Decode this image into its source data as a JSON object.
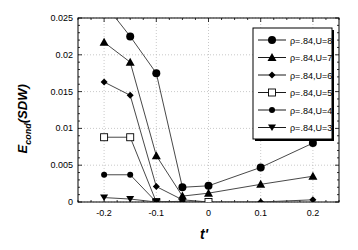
{
  "chart_data": {
    "type": "line",
    "title": "",
    "xlabel": "t'",
    "ylabel": "E_cond(SDW)",
    "ylabel_main": "E",
    "ylabel_sub": "cond",
    "ylabel_paren": "(SDW)",
    "xlim": [
      -0.25,
      0.25
    ],
    "ylim": [
      0,
      0.025
    ],
    "xticks": [
      -0.2,
      -0.1,
      0,
      0.1,
      0.2
    ],
    "xtick_labels": [
      "-0.2",
      "-0.1",
      "0",
      "0.1",
      "0.2"
    ],
    "yticks": [
      0,
      0.005,
      0.01,
      0.015,
      0.02,
      0.025
    ],
    "ytick_labels": [
      "0",
      "0.005",
      "0.01",
      "0.015",
      "0.02",
      "0.025"
    ],
    "grid": true,
    "legend_position": "upper right",
    "series": [
      {
        "name": "ρ=.84,U=8",
        "marker": "circle",
        "x": [
          -0.2,
          -0.15,
          -0.1,
          -0.05,
          0,
          0.1,
          0.2
        ],
        "values": [
          0.027,
          0.0225,
          0.0175,
          0.002,
          0.0022,
          0.0047,
          0.008
        ]
      },
      {
        "name": "ρ=.84,U=7",
        "marker": "triangle-up",
        "x": [
          -0.2,
          -0.15,
          -0.1,
          -0.05,
          0,
          0.1,
          0.2
        ],
        "values": [
          0.0217,
          0.019,
          0.0063,
          0.0008,
          0.0012,
          0.0024,
          0.0035
        ]
      },
      {
        "name": "ρ=.84,U=6",
        "marker": "diamond",
        "x": [
          -0.2,
          -0.15,
          -0.1,
          -0.05,
          0,
          0.1,
          0.2
        ],
        "values": [
          0.0163,
          0.0145,
          0.0021,
          0.0003,
          0.0,
          0.0,
          0.0003
        ]
      },
      {
        "name": "ρ=.84,U=5",
        "marker": "square-open",
        "x": [
          -0.2,
          -0.15,
          -0.1,
          0
        ],
        "values": [
          0.0088,
          0.0088,
          0.0,
          0.0
        ]
      },
      {
        "name": "ρ=.84,U=4",
        "marker": "circle-small",
        "x": [
          -0.2,
          -0.15,
          -0.1,
          -0.05
        ],
        "values": [
          0.0037,
          0.0037,
          0.0,
          0.0001
        ]
      },
      {
        "name": "ρ=.84,U=3",
        "marker": "triangle-down",
        "x": [
          -0.2,
          -0.15,
          -0.1
        ],
        "values": [
          0.0006,
          0.0004,
          0.0
        ]
      }
    ]
  }
}
